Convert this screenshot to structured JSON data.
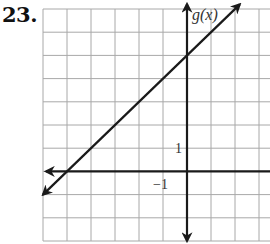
{
  "problem": {
    "number": "23."
  },
  "chart_data": {
    "type": "line",
    "title": "",
    "function_label": "g(x)",
    "xlabel": "",
    "ylabel": "g(x)",
    "grid": true,
    "xlim": [
      -6,
      3.5
    ],
    "ylim": [
      -3,
      7
    ],
    "tick_labels": [
      {
        "axis": "y",
        "value": 1,
        "text": "1"
      },
      {
        "axis": "x",
        "value": -1,
        "text": "−1"
      }
    ],
    "series": [
      {
        "name": "g(x)",
        "equation": "g(x) = x + 5",
        "slope": 1,
        "y_intercept": 5,
        "x_intercept": -5,
        "x": [
          -6,
          2.2
        ],
        "y": [
          -1,
          7.2
        ],
        "arrows": "both"
      }
    ],
    "colors": {
      "grid": "#a8a8a8",
      "axis": "#1a1a1a",
      "line": "#1a1a1a"
    }
  }
}
